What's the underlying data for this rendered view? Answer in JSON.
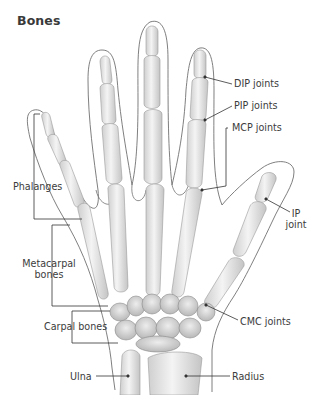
{
  "title": "Bones",
  "labels": {
    "dip": "DIP joints",
    "pip": "PIP joints",
    "mcp": "MCP joints",
    "ip_line1": "IP",
    "ip_line2": "joint",
    "phalanges": "Phalanges",
    "metacarpal_line1": "Metacarpal",
    "metacarpal_line2": "bones",
    "carpal": "Carpal bones",
    "cmc": "CMC joints",
    "ulna": "Ulna",
    "radius": "Radius"
  },
  "colors": {
    "bone_fill": "#e9e9e9",
    "bone_stroke": "#9a9a9a",
    "outline": "#707070",
    "leader": "#333333",
    "text": "#3c3c3c"
  }
}
